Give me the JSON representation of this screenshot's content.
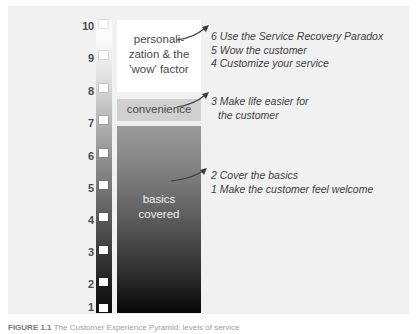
{
  "figure": {
    "background_color": "#f1f1f1",
    "caption_label": "FIGURE 1.1",
    "caption_text": "The Customer Experience Pyramid: levels of service"
  },
  "axis": {
    "name": "service-level-scale",
    "ticks": [
      "10",
      "9",
      "8",
      "7",
      "6",
      "5",
      "4",
      "3",
      "2",
      "1"
    ],
    "min": 1,
    "max": 10
  },
  "blocks": [
    {
      "id": "personalization",
      "label": "personali-\nzation & the\n'wow' factor",
      "line1": "personali-",
      "line2": "zation & the",
      "line3": "'wow' factor",
      "range": [
        8,
        10
      ],
      "fill": "#ffffff",
      "text_color": "#4a4a4a"
    },
    {
      "id": "convenience",
      "label": "convenience",
      "range": [
        7,
        8
      ],
      "fill": "#d0d0d0",
      "text_color": "#4a4a4a"
    },
    {
      "id": "basics",
      "line1": "basics",
      "line2": "covered",
      "range": [
        1,
        7
      ],
      "fill": "gradient-gray-to-black",
      "text_color": "#efefef"
    }
  ],
  "annotations": {
    "top": [
      {
        "num": "6",
        "text": "Use the Service Recovery Paradox"
      },
      {
        "num": "5",
        "text": "Wow the customer"
      },
      {
        "num": "4",
        "text": "Customize your service"
      }
    ],
    "mid": [
      {
        "num": "3",
        "text": "Make life easier for"
      },
      {
        "num": "",
        "text": "the customer"
      }
    ],
    "low": [
      {
        "num": "2",
        "text": "Cover the basics"
      },
      {
        "num": "1",
        "text": "Make the customer feel welcome"
      }
    ]
  },
  "colors": {
    "panel": "#f1f1f1",
    "axis_text": "#4d4d4d",
    "annotation_text": "#3d3d3d",
    "gradient_top": "#ffffff",
    "gradient_bottom": "#0d0d0d"
  }
}
